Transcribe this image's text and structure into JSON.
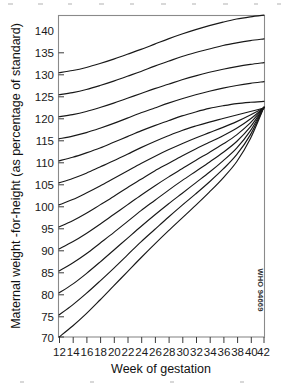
{
  "chart_data": {
    "type": "line",
    "title": "",
    "xlabel": "Week of gestation",
    "ylabel": "Maternal weight -for-height (as percentage of standard)",
    "xlim": [
      12,
      42
    ],
    "ylim": [
      70,
      143
    ],
    "xticks": [
      12,
      14,
      16,
      18,
      20,
      22,
      24,
      26,
      28,
      30,
      32,
      34,
      36,
      38,
      40,
      42
    ],
    "yticks": [
      70,
      75,
      80,
      85,
      90,
      95,
      100,
      105,
      110,
      115,
      120,
      125,
      130,
      135,
      140
    ],
    "grid": false,
    "legend": null,
    "annotations": [
      "WHO 94669"
    ],
    "x": [
      12,
      14,
      16,
      18,
      20,
      22,
      24,
      26,
      28,
      30,
      32,
      34,
      36,
      38,
      40,
      42
    ],
    "series": [
      {
        "name": "start-130",
        "start_value": 130,
        "values": [
          130.0,
          130.5,
          131.2,
          132.1,
          133.1,
          134.2,
          135.3,
          136.5,
          137.7,
          138.8,
          139.8,
          140.7,
          141.5,
          142.2,
          142.7,
          143.1
        ]
      },
      {
        "name": "start-125",
        "start_value": 125,
        "values": [
          125.0,
          125.5,
          126.2,
          127.1,
          128.1,
          129.2,
          130.3,
          131.5,
          132.6,
          133.7,
          134.6,
          135.4,
          136.2,
          136.8,
          137.3,
          137.7
        ]
      },
      {
        "name": "start-120",
        "start_value": 120,
        "values": [
          120.0,
          120.5,
          121.2,
          122.1,
          123.1,
          124.2,
          125.3,
          126.4,
          127.4,
          128.4,
          129.3,
          130.1,
          130.8,
          131.4,
          131.9,
          132.3
        ]
      },
      {
        "name": "start-115",
        "start_value": 115,
        "values": [
          115.0,
          115.6,
          116.4,
          117.4,
          118.5,
          119.7,
          120.9,
          122.0,
          123.1,
          124.1,
          125.0,
          125.8,
          126.5,
          127.1,
          127.6,
          128.0
        ]
      },
      {
        "name": "start-110",
        "start_value": 110,
        "values": [
          110.0,
          110.8,
          111.8,
          112.9,
          114.2,
          115.5,
          116.8,
          118.0,
          119.1,
          120.2,
          121.1,
          121.9,
          122.5,
          123.0,
          123.3,
          123.5
        ]
      },
      {
        "name": "start-105",
        "start_value": 105,
        "values": [
          105.0,
          106.0,
          107.2,
          108.6,
          110.0,
          111.5,
          113.0,
          114.4,
          115.7,
          116.9,
          117.9,
          118.8,
          119.6,
          120.4,
          121.2,
          122.0
        ]
      },
      {
        "name": "start-100",
        "start_value": 100,
        "values": [
          100.0,
          101.2,
          102.7,
          104.3,
          106.0,
          107.7,
          109.4,
          111.0,
          112.5,
          113.9,
          115.2,
          116.4,
          117.6,
          118.9,
          120.4,
          122.1
        ]
      },
      {
        "name": "start-95",
        "start_value": 95,
        "values": [
          95.0,
          96.4,
          98.1,
          100.0,
          101.9,
          103.9,
          105.8,
          107.7,
          109.4,
          111.1,
          112.7,
          114.2,
          115.7,
          117.4,
          119.5,
          122.1
        ]
      },
      {
        "name": "start-90",
        "start_value": 90,
        "values": [
          90.0,
          91.6,
          93.5,
          95.6,
          97.8,
          100.0,
          102.2,
          104.3,
          106.3,
          108.2,
          110.1,
          111.9,
          113.8,
          115.9,
          118.6,
          122.1
        ]
      },
      {
        "name": "start-85",
        "start_value": 85,
        "values": [
          85.0,
          86.8,
          88.9,
          91.3,
          93.7,
          96.2,
          98.7,
          101.0,
          103.3,
          105.5,
          107.6,
          109.7,
          111.9,
          114.4,
          117.7,
          122.1
        ]
      },
      {
        "name": "start-80",
        "start_value": 80,
        "values": [
          80.0,
          82.0,
          84.4,
          87.0,
          89.7,
          92.4,
          95.1,
          97.7,
          100.2,
          102.6,
          105.0,
          107.4,
          110.0,
          112.9,
          116.8,
          122.2
        ]
      },
      {
        "name": "start-75",
        "start_value": 75,
        "values": [
          75.0,
          77.3,
          79.9,
          82.7,
          85.6,
          88.6,
          91.6,
          94.4,
          97.2,
          99.9,
          102.5,
          105.2,
          108.1,
          111.4,
          115.9,
          122.2
        ]
      },
      {
        "name": "start-70",
        "start_value": 70,
        "values": [
          70.0,
          72.5,
          75.3,
          78.4,
          81.6,
          84.8,
          88.0,
          91.1,
          94.1,
          97.0,
          99.9,
          102.9,
          106.1,
          109.8,
          115.0,
          122.2
        ]
      }
    ]
  },
  "axes": {
    "y_title": "Maternal weight -for-height (as percentage of standard)",
    "x_title": "Week of gestation",
    "y_labels": [
      "140",
      "135",
      "130",
      "125",
      "120",
      "115",
      "110",
      "105",
      "100",
      "95",
      "90",
      "85",
      "80",
      "75",
      "70"
    ],
    "x_labels": [
      "12",
      "14",
      "16",
      "18",
      "20",
      "22",
      "24",
      "26",
      "28",
      "30",
      "32",
      "34",
      "36",
      "38",
      "40",
      "42"
    ]
  },
  "watermark": {
    "text": "WHO 94669"
  },
  "colors": {
    "curve": "#181818",
    "frame": "#8a8a8a",
    "text": "#1a1a1a",
    "background": "#ffffff"
  }
}
